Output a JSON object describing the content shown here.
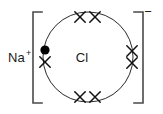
{
  "diagram": {
    "type": "dot-and-cross ionic bonding diagram",
    "compound": "NaCl",
    "cation": {
      "symbol": "Na",
      "charge": "+"
    },
    "anion": {
      "symbol": "Cl",
      "charge": "−"
    },
    "colors": {
      "background": "#ffffff",
      "circle_stroke": "#2b2b2b",
      "bracket_stroke": "#4a4a4a",
      "electron_dot": "#000000",
      "electron_cross": "#111111",
      "text": "#1a1a1a"
    },
    "shell": {
      "center_x": 88,
      "center_y": 57,
      "radius": 45,
      "electron_count": 8
    },
    "bracket": {
      "left_x": 33,
      "right_x": 143,
      "top_y": 12,
      "bottom_y": 103,
      "arm_length": 9
    },
    "electrons": [
      {
        "id": "e-transferred-left",
        "marker": "dot",
        "x": 45,
        "y": 50,
        "origin": "sodium"
      },
      {
        "id": "e-cl-left-lower",
        "marker": "cross",
        "x": 45,
        "y": 62,
        "origin": "chlorine"
      },
      {
        "id": "e-cl-top-left",
        "marker": "cross",
        "x": 80,
        "y": 17,
        "origin": "chlorine"
      },
      {
        "id": "e-cl-top-right",
        "marker": "cross",
        "x": 95,
        "y": 17,
        "origin": "chlorine"
      },
      {
        "id": "e-cl-right-upper",
        "marker": "cross",
        "x": 132,
        "y": 51,
        "origin": "chlorine"
      },
      {
        "id": "e-cl-right-lower",
        "marker": "cross",
        "x": 132,
        "y": 63,
        "origin": "chlorine"
      },
      {
        "id": "e-cl-bottom-left",
        "marker": "cross",
        "x": 80,
        "y": 97,
        "origin": "chlorine"
      },
      {
        "id": "e-cl-bottom-right",
        "marker": "cross",
        "x": 95,
        "y": 97,
        "origin": "chlorine"
      }
    ],
    "labels": {
      "cation_x": 8,
      "cation_y": 62,
      "cation_charge_x": 26,
      "cation_charge_y": 56,
      "anion_x": 82,
      "anion_y": 62,
      "charge_minus_x": 148,
      "charge_minus_y": 16
    }
  }
}
